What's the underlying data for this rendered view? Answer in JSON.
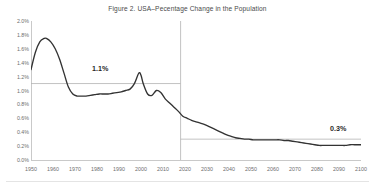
{
  "figure": {
    "title": "Figure 2. USA–Pecentage Change in the Population",
    "background_color": "#ffffff",
    "axis_color": "#c9c9c9",
    "series_color": "#333333",
    "reference_line_color": "#b3b3b3",
    "divider_color": "#b3b3b3"
  },
  "annotations": {
    "historic_average_label": "1.1%",
    "projected_average_label": "0.3%"
  },
  "chart_data": {
    "type": "line",
    "title": "Figure 2. USA–Pecentage Change in the Population",
    "xlabel": "",
    "ylabel": "",
    "xlim": [
      1950,
      2100
    ],
    "ylim": [
      0.0,
      2.0
    ],
    "grid": false,
    "legend": "none",
    "x_tick_labels": [
      "1950",
      "1960",
      "1970",
      "1980",
      "1990",
      "2000",
      "2010",
      "2020",
      "2030",
      "2040",
      "2050",
      "2060",
      "2070",
      "2080",
      "2090",
      "2100"
    ],
    "x_ticks": [
      1950,
      1960,
      1970,
      1980,
      1990,
      2000,
      2010,
      2020,
      2030,
      2040,
      2050,
      2060,
      2070,
      2080,
      2090,
      2100
    ],
    "y_tick_labels": [
      "0.0%",
      "0.2%",
      "0.4%",
      "0.6%",
      "0.8%",
      "1.0%",
      "1.2%",
      "1.4%",
      "1.6%",
      "1.8%",
      "2.0%"
    ],
    "y_ticks": [
      0.0,
      0.2,
      0.4,
      0.6,
      0.8,
      1.0,
      1.2,
      1.4,
      1.6,
      1.8,
      2.0
    ],
    "y_unit": "%",
    "series": [
      {
        "name": "USA percentage change in the population",
        "x": [
          1950,
          1952,
          1954,
          1956,
          1957,
          1959,
          1961,
          1963,
          1965,
          1967,
          1969,
          1971,
          1973,
          1975,
          1977,
          1979,
          1981,
          1983,
          1985,
          1987,
          1989,
          1991,
          1993,
          1995,
          1997,
          1999,
          2000,
          2001,
          2003,
          2005,
          2007,
          2009,
          2011,
          2013,
          2015,
          2017,
          2019,
          2021,
          2023,
          2025,
          2027,
          2029,
          2031,
          2033,
          2035,
          2037,
          2039,
          2041,
          2043,
          2045,
          2047,
          2049,
          2051,
          2053,
          2055,
          2057,
          2059,
          2061,
          2063,
          2065,
          2067,
          2069,
          2071,
          2073,
          2075,
          2077,
          2079,
          2081,
          2083,
          2085,
          2087,
          2089,
          2091,
          2093,
          2095,
          2097,
          2099,
          2100
        ],
        "y": [
          1.3,
          1.55,
          1.7,
          1.75,
          1.75,
          1.7,
          1.6,
          1.45,
          1.25,
          1.05,
          0.95,
          0.92,
          0.92,
          0.92,
          0.93,
          0.94,
          0.95,
          0.95,
          0.95,
          0.96,
          0.97,
          0.98,
          1.0,
          1.02,
          1.1,
          1.25,
          1.22,
          1.1,
          0.95,
          0.93,
          1.0,
          0.97,
          0.88,
          0.82,
          0.76,
          0.7,
          0.63,
          0.6,
          0.57,
          0.55,
          0.53,
          0.51,
          0.48,
          0.45,
          0.42,
          0.39,
          0.36,
          0.34,
          0.32,
          0.31,
          0.3,
          0.3,
          0.29,
          0.29,
          0.29,
          0.29,
          0.29,
          0.29,
          0.29,
          0.28,
          0.28,
          0.27,
          0.26,
          0.25,
          0.24,
          0.23,
          0.22,
          0.21,
          0.21,
          0.21,
          0.21,
          0.21,
          0.21,
          0.21,
          0.22,
          0.22,
          0.22,
          0.22
        ]
      }
    ],
    "reference_lines": [
      {
        "label": "1.1%",
        "value": 1.1,
        "orientation": "horizontal",
        "x_start": 1950,
        "x_end": 2018
      },
      {
        "label": "0.3%",
        "value": 0.3,
        "orientation": "horizontal",
        "x_start": 2018,
        "x_end": 2100
      }
    ],
    "divider_lines": [
      {
        "orientation": "vertical",
        "value": 2018,
        "note": "history / projection boundary"
      }
    ]
  }
}
